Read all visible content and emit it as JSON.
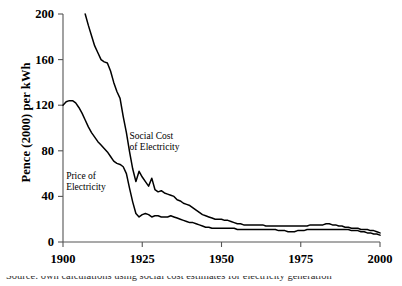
{
  "chart_data": {
    "type": "line",
    "title": "",
    "xlabel": "",
    "ylabel": "Pence (2000) per kWh",
    "xlim": [
      1900,
      2000
    ],
    "ylim": [
      0,
      200
    ],
    "xticks": [
      1900,
      1925,
      1950,
      1975,
      2000
    ],
    "yticks": [
      0,
      40,
      80,
      120,
      160,
      200
    ],
    "grid": false,
    "legend_position": "inline-annotations",
    "annotations": [
      {
        "name": "social-cost-label",
        "text_line1": "Social Cost",
        "text_line2": "of Electricity",
        "x": 1921,
        "y": 92
      },
      {
        "name": "price-label",
        "text_line1": "Price of",
        "text_line2": "Electricity",
        "x": 1901,
        "y": 57
      }
    ],
    "series": [
      {
        "name": "Social Cost of Electricity",
        "color": "#000000",
        "x": [
          1907,
          1908,
          1909,
          1910,
          1911,
          1912,
          1913,
          1914,
          1915,
          1916,
          1917,
          1918,
          1919,
          1920,
          1921,
          1922,
          1923,
          1924,
          1925,
          1926,
          1927,
          1928,
          1929,
          1930,
          1931,
          1932,
          1933,
          1934,
          1935,
          1936,
          1937,
          1938,
          1939,
          1940,
          1941,
          1942,
          1943,
          1944,
          1945,
          1946,
          1947,
          1948,
          1949,
          1950,
          1951,
          1952,
          1953,
          1954,
          1955,
          1956,
          1957,
          1958,
          1959,
          1960,
          1961,
          1962,
          1963,
          1964,
          1965,
          1966,
          1967,
          1968,
          1969,
          1970,
          1971,
          1972,
          1973,
          1974,
          1975,
          1976,
          1977,
          1978,
          1979,
          1980,
          1981,
          1982,
          1983,
          1984,
          1985,
          1986,
          1987,
          1988,
          1989,
          1990,
          1991,
          1992,
          1993,
          1994,
          1995,
          1996,
          1997,
          1998,
          1999,
          2000
        ],
        "y": [
          200,
          190,
          181,
          172,
          166,
          160,
          158,
          157,
          150,
          140,
          132,
          126,
          110,
          96,
          79,
          64,
          53,
          62,
          57,
          53,
          49,
          56,
          46,
          44,
          45,
          43,
          42,
          41,
          40,
          37,
          36,
          34,
          33,
          32,
          30,
          28,
          26,
          24,
          23,
          22,
          21,
          20,
          20,
          20,
          19,
          19,
          18,
          17,
          16,
          16,
          15,
          15,
          15,
          15,
          15,
          15,
          15,
          14,
          14,
          14,
          14,
          14,
          14,
          14,
          14,
          14,
          14,
          14,
          14,
          14,
          14,
          15,
          15,
          15,
          15,
          15,
          16,
          16,
          15,
          15,
          14,
          14,
          13,
          13,
          12,
          12,
          12,
          11,
          11,
          11,
          10,
          10,
          9,
          8
        ]
      },
      {
        "name": "Price of Electricity",
        "color": "#000000",
        "x": [
          1900,
          1901,
          1902,
          1903,
          1904,
          1905,
          1906,
          1907,
          1908,
          1909,
          1910,
          1911,
          1912,
          1913,
          1914,
          1915,
          1916,
          1917,
          1918,
          1919,
          1920,
          1921,
          1922,
          1923,
          1924,
          1925,
          1926,
          1927,
          1928,
          1929,
          1930,
          1931,
          1932,
          1933,
          1934,
          1935,
          1936,
          1937,
          1938,
          1939,
          1940,
          1941,
          1942,
          1943,
          1944,
          1945,
          1946,
          1947,
          1948,
          1949,
          1950,
          1951,
          1952,
          1953,
          1954,
          1955,
          1956,
          1957,
          1958,
          1959,
          1960,
          1961,
          1962,
          1963,
          1964,
          1965,
          1966,
          1967,
          1968,
          1969,
          1970,
          1971,
          1972,
          1973,
          1974,
          1975,
          1976,
          1977,
          1978,
          1979,
          1980,
          1981,
          1982,
          1983,
          1984,
          1985,
          1986,
          1987,
          1988,
          1989,
          1990,
          1991,
          1992,
          1993,
          1994,
          1995,
          1996,
          1997,
          1998,
          1999,
          2000
        ],
        "y": [
          120,
          123,
          124,
          124,
          122,
          118,
          113,
          107,
          101,
          96,
          92,
          88,
          85,
          82,
          79,
          75,
          71,
          69,
          68,
          66,
          60,
          47,
          35,
          25,
          22,
          24,
          25,
          24,
          22,
          23,
          23,
          22,
          22,
          22,
          23,
          22,
          21,
          20,
          19,
          18,
          17,
          17,
          16,
          15,
          14,
          13,
          13,
          12,
          12,
          12,
          12,
          12,
          12,
          12,
          12,
          11,
          11,
          11,
          11,
          11,
          11,
          11,
          11,
          11,
          11,
          11,
          11,
          11,
          10,
          10,
          10,
          9,
          9,
          9,
          10,
          10,
          10,
          11,
          11,
          11,
          11,
          11,
          11,
          11,
          11,
          11,
          11,
          11,
          11,
          11,
          11,
          10,
          10,
          10,
          9,
          9,
          8,
          8,
          7,
          7,
          6
        ]
      }
    ]
  },
  "caption": {
    "clipped_text": "figure caption partially visible"
  }
}
